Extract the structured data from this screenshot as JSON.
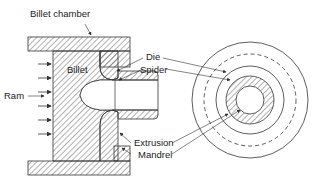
{
  "diagram": {
    "type": "extrusion-die-cross-section",
    "labels": {
      "billet_chamber": "Billet chamber",
      "billet": "Billet",
      "ram": "Ram",
      "die": "Die",
      "spider": "Spider",
      "extrusion": "Extrusion",
      "mandrel": "Mandrel"
    },
    "colors": {
      "stroke": "#333333",
      "hatch": "#555555",
      "text": "#222222",
      "background": "#ffffff"
    }
  }
}
